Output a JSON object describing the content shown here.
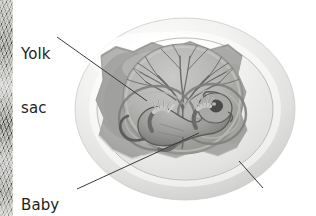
{
  "figure": {
    "width": 316,
    "height": 216,
    "background_color": "#ffffff"
  },
  "labels": [
    {
      "id": "yolk-sac",
      "text": "Yolk\nsac",
      "line1": "Yolk",
      "line2": "sac",
      "color": "#231f20",
      "leader": {
        "x1": 57,
        "y1": 37,
        "x2": 147,
        "y2": 101
      }
    },
    {
      "id": "baby-reptile",
      "text": "Baby\nreptile",
      "line1": "Baby",
      "line2": "reptile",
      "color": "#231f20",
      "leader": {
        "x1": 77,
        "y1": 189,
        "x2": 199,
        "y2": 133
      }
    },
    {
      "id": "shell",
      "text": "Shell",
      "line1": "Shell",
      "line2": "",
      "color": "#231f20",
      "leader": {
        "x1": 239,
        "y1": 161,
        "x2": 263,
        "y2": 188
      }
    }
  ],
  "anatomy": {
    "shell": {
      "name": "Shell",
      "color": "#e9e9e7",
      "highlight_color": "#fbfbfa",
      "shadow_color": "#c3c3c1"
    },
    "shell_interior": {
      "name": "Cut-away shell interior",
      "color": "#b6b6b4"
    },
    "albumen": {
      "name": "Albumen / membrane cavity",
      "color": "#a9a9a7"
    },
    "yolk_sac": {
      "name": "Yolk sac",
      "color": "#b0b0ae",
      "rim_color": "#8e8e8c"
    },
    "blood_vessels": {
      "name": "Yolk sac blood vessels",
      "color": "#6e6e6c"
    },
    "embryo": {
      "name": "Baby reptile embryo",
      "body_color": "#9a9a98",
      "outline_color": "#5d5d5b",
      "eye_color": "#4a4a48",
      "limb_color": "#d3d3d1"
    },
    "edge_strip": {
      "name": "Page edge texture strip",
      "color": "#9c9c9a",
      "width": 13
    }
  },
  "palette": {
    "ink": "#231f20",
    "leader_line": "#3a3a38",
    "paper": "#ffffff"
  }
}
